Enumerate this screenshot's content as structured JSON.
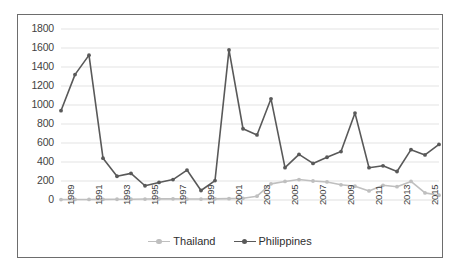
{
  "chart_data": {
    "type": "line",
    "title": "",
    "subtitle": "",
    "xlabel": "",
    "ylabel": "",
    "ylim": [
      0,
      1800
    ],
    "ytick_step": 200,
    "yticks": [
      0,
      200,
      400,
      600,
      800,
      1000,
      1200,
      1400,
      1600,
      1800
    ],
    "ytick_labels": [
      "0",
      "200",
      "400",
      "600",
      "800",
      "1000",
      "1200",
      "1400",
      "1600",
      "1800"
    ],
    "grid": "horizontal",
    "legend_position": "bottom-center",
    "x": [
      1989,
      1990,
      1991,
      1992,
      1993,
      1994,
      1995,
      1996,
      1997,
      1998,
      1999,
      2000,
      2001,
      2002,
      2003,
      2004,
      2005,
      2006,
      2007,
      2008,
      2009,
      2010,
      2011,
      2012,
      2013,
      2014,
      2015,
      2016
    ],
    "xtick_labels": [
      "1989",
      "1991",
      "1993",
      "1995",
      "1997",
      "1999",
      "2001",
      "2003",
      "2005",
      "2007",
      "2009",
      "2011",
      "2013",
      "2015"
    ],
    "xtick_values": [
      1989,
      1991,
      1993,
      1995,
      1997,
      1999,
      2001,
      2003,
      2005,
      2007,
      2009,
      2011,
      2013,
      2015
    ],
    "series": [
      {
        "name": "Thailand",
        "color": "#bfbfbf",
        "marker": "circle",
        "values": [
          5,
          6,
          6,
          7,
          8,
          8,
          10,
          12,
          12,
          10,
          10,
          12,
          14,
          18,
          40,
          170,
          195,
          215,
          200,
          190,
          160,
          145,
          95,
          155,
          140,
          195,
          75,
          50
        ]
      },
      {
        "name": "Philippines",
        "color": "#595959",
        "marker": "circle",
        "values": [
          940,
          1320,
          1525,
          440,
          250,
          280,
          150,
          185,
          215,
          315,
          100,
          205,
          1580,
          750,
          685,
          1065,
          340,
          480,
          385,
          450,
          510,
          915,
          340,
          360,
          300,
          530,
          475,
          585
        ]
      }
    ]
  },
  "legend": {
    "items": [
      {
        "label": "Thailand",
        "color": "#bfbfbf"
      },
      {
        "label": "Philippines",
        "color": "#595959"
      }
    ]
  },
  "style": {
    "frame_border": "#6d6d6d",
    "gridline": "#e0e0e0",
    "tick_text": "#3f3f3f",
    "background": "#ffffff"
  }
}
